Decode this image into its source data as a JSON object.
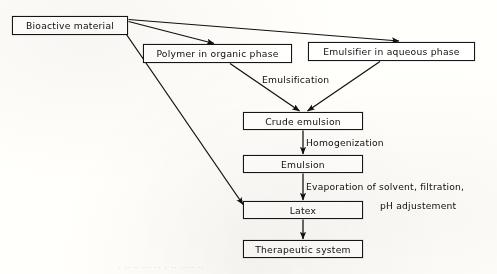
{
  "figure": {
    "type": "process-flow-diagram",
    "background_color": "#fbfaf7",
    "ink_color": "#141414"
  },
  "nodes": [
    {
      "id": "bioactive-material",
      "label": "Bioactive material",
      "x": 12,
      "y": 16,
      "w": 116,
      "h": 19,
      "font_size": 9.2
    },
    {
      "id": "polymer-organic-phase",
      "label": "Polymer in organic phase",
      "x": 143,
      "y": 44,
      "w": 149,
      "h": 19,
      "font_size": 9.2
    },
    {
      "id": "emulsifier-aqueous-phase",
      "label": "Emulsifier in aqueous phase",
      "x": 308,
      "y": 42,
      "w": 167,
      "h": 19,
      "font_size": 9.2
    },
    {
      "id": "crude-emulsion",
      "label": "Crude emulsion",
      "x": 243,
      "y": 112,
      "w": 120,
      "h": 18,
      "font_size": 9.2
    },
    {
      "id": "emulsion",
      "label": "Emulsion",
      "x": 243,
      "y": 155,
      "w": 120,
      "h": 18,
      "font_size": 9.2
    },
    {
      "id": "latex",
      "label": "Latex",
      "x": 243,
      "y": 201,
      "w": 120,
      "h": 18,
      "font_size": 9.2
    },
    {
      "id": "therapeutic-system",
      "label": "Therapeutic system",
      "x": 243,
      "y": 240,
      "w": 120,
      "h": 18,
      "font_size": 9.2
    }
  ],
  "edge_labels": [
    {
      "id": "emulsification",
      "text": "Emulsification",
      "x": 262,
      "y": 74,
      "font_size": 9.2
    },
    {
      "id": "homogenization",
      "text": "Homogenization",
      "x": 306,
      "y": 137,
      "font_size": 9.2
    },
    {
      "id": "evaporation-line-1",
      "text": "Evaporation of solvent, filtration,",
      "x": 306,
      "y": 181,
      "font_size": 9.2
    },
    {
      "id": "evaporation-line-2",
      "text": "pH adjustement",
      "x": 380,
      "y": 200,
      "font_size": 9.2
    }
  ],
  "edges": [
    {
      "id": "bioactive-to-polymer",
      "from": "bioactive-material",
      "to": "polymer-organic-phase",
      "style": "diagonal-arrow"
    },
    {
      "id": "bioactive-to-emulsifier",
      "from": "bioactive-material",
      "to": "emulsifier-aqueous-phase",
      "style": "diagonal-arrow"
    },
    {
      "id": "bioactive-to-latex",
      "from": "bioactive-material",
      "to": "latex",
      "style": "long-diagonal-arrow"
    },
    {
      "id": "polymer-to-crude",
      "from": "polymer-organic-phase",
      "to": "crude-emulsion",
      "style": "diagonal-arrow"
    },
    {
      "id": "emulsifier-to-crude",
      "from": "emulsifier-aqueous-phase",
      "to": "crude-emulsion",
      "style": "diagonal-arrow"
    },
    {
      "id": "crude-to-emulsion",
      "from": "crude-emulsion",
      "to": "emulsion",
      "style": "vertical-arrow"
    },
    {
      "id": "emulsion-to-latex",
      "from": "emulsion",
      "to": "latex",
      "style": "vertical-arrow"
    },
    {
      "id": "latex-to-therapeutic",
      "from": "latex",
      "to": "therapeutic-system",
      "style": "vertical-arrow"
    }
  ],
  "caption": {
    "text": "·  ··   · ···  ·· · ··  ····  ··",
    "note": "cropped-illegible-figure-caption"
  }
}
